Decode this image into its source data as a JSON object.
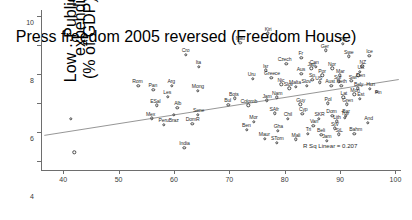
{
  "chart_data": {
    "type": "scatter",
    "title": "",
    "xlabel": "Press freedom 2005 reversed (Freedom House)",
    "ylabel": "Low ··Public health expenditure (% of GDP) ··High",
    "ylabel_line1": "Low ··Public health expenditure",
    "ylabel_line2": "(% of GDP) ··High",
    "xlim": [
      36,
      101
    ],
    "ylim": [
      -0.6,
      10.4
    ],
    "xticks": [
      40,
      50,
      60,
      70,
      80,
      90,
      100
    ],
    "yticks": [
      0,
      2,
      4,
      6,
      8,
      10
    ],
    "grid": false,
    "legend": null,
    "annotation": "R Sq Linear = 0.207",
    "fit_line": {
      "type": "linear",
      "x_start": 36.6,
      "y_start": 1.78,
      "x_end": 100.6,
      "y_end": 5.62,
      "r_squared": 0.207
    },
    "points": [
      {
        "label": "",
        "x": 41.4,
        "y": 2.92
      },
      {
        "label": "",
        "x": 42.0,
        "y": 0.62
      },
      {
        "label": "Rom",
        "x": 53.6,
        "y": 5.18,
        "lx": -1.0,
        "ly": -4.6
      },
      {
        "label": "Cro",
        "x": 62.1,
        "y": 7.34,
        "lx": 0.0,
        "ly": -4.6
      },
      {
        "label": "Ita",
        "x": 64.5,
        "y": 6.5,
        "lx": -0.4,
        "ly": -4.6
      },
      {
        "label": "Pan",
        "x": 56.3,
        "y": 4.92,
        "lx": -0.6,
        "ly": -4.6
      },
      {
        "label": "Arg",
        "x": 59.6,
        "y": 5.2,
        "lx": -0.4,
        "ly": -4.6
      },
      {
        "label": "Mong",
        "x": 64.3,
        "y": 4.84,
        "lx": 0.2,
        "ly": -4.6
      },
      {
        "label": "Les",
        "x": 58.9,
        "y": 4.42,
        "lx": -0.6,
        "ly": -4.6
      },
      {
        "label": "ESal",
        "x": 56.9,
        "y": 3.84,
        "lx": -1.4,
        "ly": -4.6
      },
      {
        "label": "Alb",
        "x": 60.6,
        "y": 3.66,
        "lx": 0.4,
        "ly": -4.6
      },
      {
        "label": "Mex",
        "x": 56.0,
        "y": 2.96,
        "lx": -1.2,
        "ly": -4.6
      },
      {
        "label": "Braz",
        "x": 60.0,
        "y": 3.18,
        "lx": -0.2,
        "ly": 4.8
      },
      {
        "label": "Sene",
        "x": 64.3,
        "y": 3.18,
        "lx": 0.8,
        "ly": -4.6
      },
      {
        "label": "Peru",
        "x": 58.2,
        "y": 2.5,
        "lx": -0.4,
        "ly": -4.6
      },
      {
        "label": "DomR",
        "x": 63.3,
        "y": 2.56,
        "lx": 0.4,
        "ly": -4.6
      },
      {
        "label": "India",
        "x": 61.9,
        "y": 0.92,
        "lx": 0.0,
        "ly": -4.6
      },
      {
        "label": "Nau",
        "x": 72.0,
        "y": 8.16,
        "lx": -0.2,
        "ly": -4.6
      },
      {
        "label": "Kiri",
        "x": 77.0,
        "y": 8.8,
        "lx": 0.0,
        "ly": -4.6
      },
      {
        "label": "Czech",
        "x": 80.3,
        "y": 6.72,
        "lx": -1.8,
        "ly": -4.6
      },
      {
        "label": "Fr",
        "x": 83.0,
        "y": 7.1,
        "lx": -0.6,
        "ly": -4.6
      },
      {
        "label": "Ger",
        "x": 87.4,
        "y": 7.62,
        "lx": -1.0,
        "ly": -4.6
      },
      {
        "label": "Pal",
        "x": 90.5,
        "y": 8.06,
        "lx": 0.2,
        "ly": -4.6
      },
      {
        "label": "Swe",
        "x": 91.6,
        "y": 7.22,
        "lx": -0.2,
        "ly": -4.6
      },
      {
        "label": "Ice",
        "x": 95.3,
        "y": 7.26,
        "lx": 0.0,
        "ly": -4.6
      },
      {
        "label": "Isr",
        "x": 76.6,
        "y": 6.26,
        "lx": -0.2,
        "ly": -4.6
      },
      {
        "label": "Jap",
        "x": 84.8,
        "y": 6.38,
        "lx": 0.0,
        "ly": -4.6
      },
      {
        "label": "Aus",
        "x": 83.0,
        "y": 6.02,
        "lx": -0.4,
        "ly": -4.6
      },
      {
        "label": "Nor",
        "x": 88.6,
        "y": 6.4,
        "lx": -0.4,
        "ly": -4.6
      },
      {
        "label": "Can",
        "x": 85.6,
        "y": 6.5,
        "lx": -1.4,
        "ly": -4.6
      },
      {
        "label": "NZ",
        "x": 94.0,
        "y": 6.54,
        "lx": 0.6,
        "ly": -4.6
      },
      {
        "label": "UK",
        "x": 93.6,
        "y": 6.14,
        "lx": 0.8,
        "ly": -4.6
      },
      {
        "label": "Den",
        "x": 93.3,
        "y": 5.9,
        "lx": 2.2,
        "ly": 0.0
      },
      {
        "label": "Por",
        "x": 86.8,
        "y": 5.9,
        "lx": -0.4,
        "ly": -4.6
      },
      {
        "label": "Mar",
        "x": 90.0,
        "y": 5.9,
        "lx": 0.2,
        "ly": -4.6
      },
      {
        "label": "Uru",
        "x": 74.2,
        "y": 5.66,
        "lx": -1.0,
        "ly": -4.6
      },
      {
        "label": "Greece",
        "x": 77.6,
        "y": 5.74,
        "lx": 0.6,
        "ly": -4.6
      },
      {
        "label": "Sp",
        "x": 85.0,
        "y": 5.62,
        "lx": -0.4,
        "ly": -4.6
      },
      {
        "label": "Swi",
        "x": 92.0,
        "y": 5.52,
        "lx": 1.4,
        "ly": -3.6
      },
      {
        "label": "Sur",
        "x": 89.8,
        "y": 5.5,
        "lx": -1.2,
        "ly": -4.6
      },
      {
        "label": "Aust",
        "x": 88.4,
        "y": 5.18,
        "lx": -1.2,
        "ly": -4.6
      },
      {
        "label": "Neth",
        "x": 90.2,
        "y": 5.18,
        "lx": 0.4,
        "ly": -4.6
      },
      {
        "label": "Bely",
        "x": 93.2,
        "y": 5.02,
        "lx": 0.8,
        "ly": -4.6
      },
      {
        "label": "Slov",
        "x": 84.0,
        "y": 5.18,
        "lx": -0.6,
        "ly": -4.6
      },
      {
        "label": "Malta",
        "x": 82.0,
        "y": 5.14,
        "lx": -0.8,
        "ly": -4.6
      },
      {
        "label": "US",
        "x": 86.3,
        "y": 5.42,
        "lx": -1.0,
        "ly": -4.6
      },
      {
        "label": "Nic",
        "x": 79.4,
        "y": 5.3,
        "lx": -0.4,
        "ly": -4.6
      },
      {
        "label": "Slov",
        "x": 80.8,
        "y": 5.02,
        "lx": -0.8,
        "ly": -4.6
      },
      {
        "label": "Hun",
        "x": 95.4,
        "y": 5.0,
        "lx": 0.6,
        "ly": -4.6
      },
      {
        "label": "Fin",
        "x": 96.6,
        "y": 4.78,
        "lx": 1.4,
        "ly": 0.6
      },
      {
        "label": "Bots",
        "x": 71.0,
        "y": 4.32,
        "lx": -1.0,
        "ly": -4.6
      },
      {
        "label": "Nam",
        "x": 78.6,
        "y": 4.4,
        "lx": 0.2,
        "ly": -4.6
      },
      {
        "label": "Bul",
        "x": 69.8,
        "y": 3.88,
        "lx": -0.6,
        "ly": -4.6
      },
      {
        "label": "Colomb",
        "x": 73.4,
        "y": 3.84,
        "lx": 0.6,
        "ly": -4.6
      },
      {
        "label": "Guy",
        "x": 82.8,
        "y": 3.92,
        "lx": 0.4,
        "ly": -4.6
      },
      {
        "label": "Pol",
        "x": 87.8,
        "y": 3.98,
        "lx": 0.2,
        "ly": -4.6
      },
      {
        "label": "Gren",
        "x": 91.2,
        "y": 3.92,
        "lx": 0.8,
        "ly": -4.6
      },
      {
        "label": "Jam",
        "x": 76.8,
        "y": 4.18,
        "lx": 0.0,
        "ly": -4.6
      },
      {
        "label": "Est",
        "x": 93.6,
        "y": 4.28,
        "lx": 0.8,
        "ly": -4.6
      },
      {
        "label": "Lat",
        "x": 90.6,
        "y": 4.4,
        "lx": 0.4,
        "ly": -4.6
      },
      {
        "label": "Mon",
        "x": 92.6,
        "y": 4.6,
        "lx": 0.6,
        "ly": -4.6
      },
      {
        "label": "SAfr",
        "x": 78.2,
        "y": 3.3,
        "lx": -0.6,
        "ly": -4.6
      },
      {
        "label": "Cyp",
        "x": 83.2,
        "y": 3.28,
        "lx": 0.8,
        "ly": -4.6
      },
      {
        "label": "Chil",
        "x": 80.6,
        "y": 2.92,
        "lx": -0.2,
        "ly": -4.6
      },
      {
        "label": "SKR",
        "x": 86.2,
        "y": 2.9,
        "lx": 0.4,
        "ly": -4.6
      },
      {
        "label": "Tuv",
        "x": 90.8,
        "y": 2.98,
        "lx": 0.6,
        "ly": -4.6
      },
      {
        "label": "Mor",
        "x": 74.4,
        "y": 2.7,
        "lx": -0.2,
        "ly": -4.6
      },
      {
        "label": "Ben",
        "x": 73.2,
        "y": 2.16,
        "lx": -0.6,
        "ly": -4.6
      },
      {
        "label": "Gha",
        "x": 78.8,
        "y": 2.08,
        "lx": 0.2,
        "ly": -4.6
      },
      {
        "label": "Van",
        "x": 85.2,
        "y": 2.42,
        "lx": 0.6,
        "ly": -4.6
      },
      {
        "label": "Dom",
        "x": 88.6,
        "y": 3.14,
        "lx": -0.8,
        "ly": -4.6
      },
      {
        "label": "Bar",
        "x": 91.0,
        "y": 3.12,
        "lx": 0.4,
        "ly": -4.6
      },
      {
        "label": "Lith",
        "x": 89.4,
        "y": 2.74,
        "lx": 0.2,
        "ly": -4.6
      },
      {
        "label": "And",
        "x": 95.0,
        "y": 2.66,
        "lx": 0.8,
        "ly": -4.6
      },
      {
        "label": "StV",
        "x": 89.0,
        "y": 2.26,
        "lx": 0.4,
        "ly": -4.6
      },
      {
        "label": "Beli",
        "x": 86.6,
        "y": 1.84,
        "lx": -0.2,
        "ly": -4.6
      },
      {
        "label": "StL",
        "x": 89.8,
        "y": 1.86,
        "lx": 0.2,
        "ly": -4.6
      },
      {
        "label": "Bahm",
        "x": 92.6,
        "y": 1.9,
        "lx": 1.2,
        "ly": -4.6
      },
      {
        "label": "Jam",
        "x": 87.6,
        "y": 1.4,
        "lx": 0.0,
        "ly": -4.6
      },
      {
        "label": "Maur",
        "x": 76.4,
        "y": 1.56,
        "lx": -0.4,
        "ly": -4.6
      },
      {
        "label": "STom",
        "x": 78.6,
        "y": 1.26,
        "lx": 0.4,
        "ly": -4.6
      },
      {
        "label": "Mali",
        "x": 82.0,
        "y": 1.5,
        "lx": 0.2,
        "ly": -4.6
      },
      {
        "label": "Tri",
        "x": 84.2,
        "y": 1.88,
        "lx": 0.4,
        "ly": -4.6
      }
    ]
  }
}
